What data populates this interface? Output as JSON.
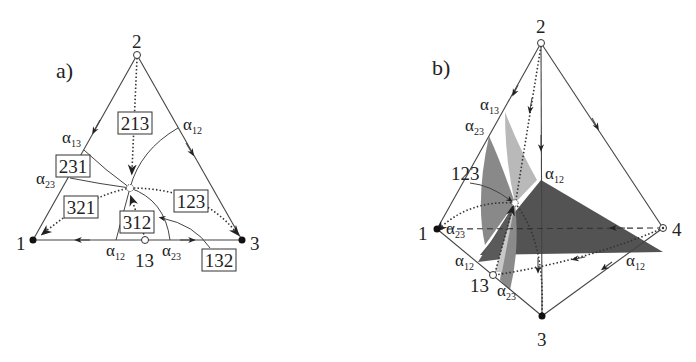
{
  "panels": {
    "a": {
      "label": "a)",
      "vertices": {
        "v1": "1",
        "v2": "2",
        "v3": "3",
        "v13": "13"
      },
      "boxes": [
        "213",
        "231",
        "321",
        "312",
        "123",
        "132"
      ],
      "alphas": {
        "a13": {
          "greek": "α",
          "sub": "13"
        },
        "a12_top": {
          "greek": "α",
          "sub": "12"
        },
        "a23_left": {
          "greek": "α",
          "sub": "23"
        },
        "a12_bottom": {
          "greek": "α",
          "sub": "12"
        },
        "a23_bottom": {
          "greek": "α",
          "sub": "23"
        }
      }
    },
    "b": {
      "label": "b)",
      "vertices": {
        "v1": "1",
        "v2": "2",
        "v3": "3",
        "v4": "4",
        "v13": "13"
      },
      "tag": "123",
      "alphas": {
        "a13": {
          "greek": "α",
          "sub": "13"
        },
        "a23_top": {
          "greek": "α",
          "sub": "23"
        },
        "a12_mid": {
          "greek": "α",
          "sub": "12"
        },
        "a23_left": {
          "greek": "α",
          "sub": "23"
        },
        "a12_left": {
          "greek": "α",
          "sub": "12"
        },
        "a23_bottom": {
          "greek": "α",
          "sub": "23"
        },
        "a12_right": {
          "greek": "α",
          "sub": "12"
        }
      },
      "colors": {
        "dark": "#4a4a4a",
        "medium": "#7c7c7c",
        "light": "#b9b9b9"
      }
    }
  }
}
